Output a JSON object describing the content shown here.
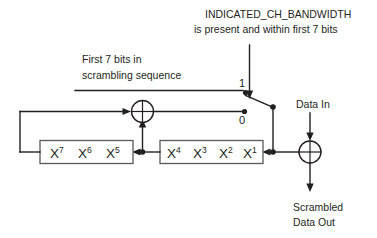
{
  "diagram": {
    "colors": {
      "line": "#231f20",
      "box_stroke": "#58595b",
      "background": "#ffffff"
    },
    "labels": {
      "control_line1": "INDICATED_CH_BANDWIDTH",
      "control_line2": "is present and within first 7 bits",
      "source_line1": "First 7 bits in",
      "source_line2": "scrambling sequence",
      "data_in": "Data In",
      "output_line1": "Scrambled",
      "output_line2": "Data Out"
    },
    "selector": {
      "position_one": "1",
      "position_zero": "0"
    },
    "registers": [
      {
        "name": "left-shift-register",
        "taps": [
          {
            "base": "X",
            "exp": "7"
          },
          {
            "base": "X",
            "exp": "6"
          },
          {
            "base": "X",
            "exp": "5"
          }
        ]
      },
      {
        "name": "right-shift-register",
        "taps": [
          {
            "base": "X",
            "exp": "4"
          },
          {
            "base": "X",
            "exp": "3"
          },
          {
            "base": "X",
            "exp": "2"
          },
          {
            "base": "X",
            "exp": "1"
          }
        ]
      }
    ],
    "gates": [
      {
        "name": "feedback-xor-gate",
        "symbol": "XOR"
      },
      {
        "name": "output-xor-gate",
        "symbol": "XOR"
      }
    ]
  }
}
